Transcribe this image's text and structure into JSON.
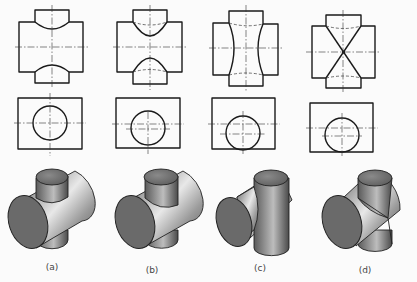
{
  "figure": {
    "panels": [
      {
        "label": "(a)",
        "description": "Vertical cylinder smaller than horizontal cylinder; intersection curves bend toward the larger cylinder axis"
      },
      {
        "label": "(b)",
        "description": "Vertical cylinder offset; intersection curves shown with hidden lines"
      },
      {
        "label": "(c)",
        "description": "Vertical cylinder larger than horizontal cylinder; curves bend toward vertical axis"
      },
      {
        "label": "(d)",
        "description": "Equal-diameter cylinders; intersection curves become straight crossing lines"
      }
    ],
    "rows": [
      "front-view",
      "top-view",
      "isometric-view"
    ]
  }
}
